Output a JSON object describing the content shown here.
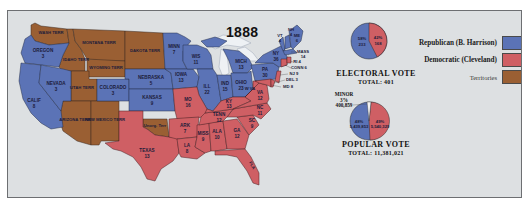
{
  "title": "1888",
  "colors": {
    "republican": "#5b73b6",
    "democratic": "#cf5f64",
    "territory": "#9a5f33",
    "background": "#dde0e2",
    "water": "#e6eaee",
    "border": "#4a3b3b"
  },
  "legend": {
    "items": [
      {
        "label": "Republican (B. Harrison)",
        "key": "republican"
      },
      {
        "label": "Democratic (Cleveland)",
        "key": "democratic"
      },
      {
        "label": "Territories",
        "key": "territory"
      }
    ]
  },
  "electoral_vote": {
    "caption": "ELECTORAL VOTE",
    "total_label": "TOTAL: 401",
    "republican": {
      "pct": "58%",
      "votes": "233"
    },
    "democratic": {
      "pct": "42%",
      "votes": "168"
    }
  },
  "popular_vote": {
    "caption": "POPULAR VOTE",
    "total_label": "TOTAL: 11,381,021",
    "republican": {
      "pct": "48%",
      "votes": "5,439,853"
    },
    "democratic": {
      "pct": "49%",
      "votes": "5,540,329"
    },
    "minor": {
      "label": "MINOR",
      "pct": "3%",
      "votes": "400,859"
    }
  },
  "states": {
    "wash": {
      "name": "WASH TERR",
      "ev": ""
    },
    "oregon": {
      "name": "OREGON",
      "ev": "3"
    },
    "calif": {
      "name": "CALIF",
      "ev": "8"
    },
    "nevada": {
      "name": "NEVADA",
      "ev": "3"
    },
    "idaho": {
      "name": "IDAHO TERR",
      "ev": ""
    },
    "montana": {
      "name": "MONTANA TERR",
      "ev": ""
    },
    "wyoming": {
      "name": "WYOMING TERR",
      "ev": ""
    },
    "utah": {
      "name": "UTAH TERR",
      "ev": ""
    },
    "arizona": {
      "name": "ARIZONA TERR",
      "ev": ""
    },
    "newmexico": {
      "name": "NEW MEXICO TERR",
      "ev": ""
    },
    "colorado": {
      "name": "COLORADO",
      "ev": "3"
    },
    "dakota": {
      "name": "DAKOTA TERR",
      "ev": ""
    },
    "nebraska": {
      "name": "NEBRASKA",
      "ev": "5"
    },
    "kansas": {
      "name": "KANSAS",
      "ev": "9"
    },
    "unorg": {
      "name": "Unorg. Terr",
      "ev": ""
    },
    "texas": {
      "name": "TEXAS",
      "ev": "13"
    },
    "minn": {
      "name": "MINN",
      "ev": "7"
    },
    "iowa": {
      "name": "IOWA",
      "ev": "13"
    },
    "mo": {
      "name": "MO",
      "ev": "16"
    },
    "ark": {
      "name": "ARK",
      "ev": "7"
    },
    "la": {
      "name": "LA",
      "ev": "8"
    },
    "wis": {
      "name": "WIS",
      "ev": "11"
    },
    "ill": {
      "name": "ILL",
      "ev": "22"
    },
    "mich": {
      "name": "MICH",
      "ev": "13"
    },
    "ind": {
      "name": "IND",
      "ev": "15"
    },
    "ohio": {
      "name": "OHIO",
      "ev": "23"
    },
    "ky": {
      "name": "KY",
      "ev": "13"
    },
    "tenn": {
      "name": "TENN",
      "ev": "12"
    },
    "miss": {
      "name": "MISS",
      "ev": "9"
    },
    "ala": {
      "name": "ALA",
      "ev": "10"
    },
    "ga": {
      "name": "GA",
      "ev": "12"
    },
    "fla": {
      "name": "FLA",
      "ev": "4"
    },
    "sc": {
      "name": "SC",
      "ev": "9"
    },
    "nc": {
      "name": "NC",
      "ev": "11"
    },
    "va": {
      "name": "VA",
      "ev": "12"
    },
    "wva": {
      "name": "W VA",
      "ev": "6"
    },
    "pa": {
      "name": "PA",
      "ev": "30"
    },
    "ny": {
      "name": "NY",
      "ev": "36"
    },
    "vt": {
      "name": "VT",
      "ev": "4"
    },
    "nh": {
      "name": "NH",
      "ev": "4"
    },
    "me": {
      "name": "ME",
      "ev": "6"
    },
    "mass": {
      "name": "MASS",
      "ev": "14"
    },
    "ri": {
      "name": "RI 4",
      "ev": ""
    },
    "conn": {
      "name": "CONN 6",
      "ev": ""
    },
    "nj": {
      "name": "NJ 9",
      "ev": ""
    },
    "del": {
      "name": "DEL 3",
      "ev": ""
    },
    "md": {
      "name": "MD 8",
      "ev": ""
    }
  }
}
